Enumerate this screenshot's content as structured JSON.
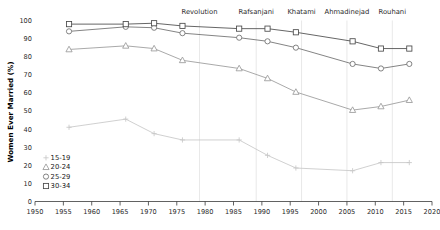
{
  "chart_data": {
    "type": "line",
    "title": "",
    "xlabel": "",
    "ylabel": "Women Ever Married (%)",
    "xlim": [
      1950,
      2020
    ],
    "ylim": [
      0,
      100
    ],
    "xticks": [
      1950,
      1955,
      1960,
      1965,
      1970,
      1975,
      1980,
      1985,
      1990,
      1995,
      2000,
      2005,
      2010,
      2015,
      2020
    ],
    "yticks": [
      0,
      10,
      20,
      30,
      40,
      50,
      60,
      70,
      80,
      90,
      100
    ],
    "grid": false,
    "legend_position": "lower-left",
    "x": [
      1956,
      1966,
      1971,
      1976,
      1986,
      1991,
      1996,
      2006,
      2011,
      2016
    ],
    "series": [
      {
        "name": "15-19",
        "marker": "plus",
        "color": "#c8c8c8",
        "values": [
          41,
          45.5,
          37.5,
          34,
          34,
          25.5,
          18.5,
          17,
          21.5,
          21.5
        ]
      },
      {
        "name": "20-24",
        "marker": "triangle",
        "color": "#9a9a9a",
        "values": [
          84,
          86,
          84.5,
          78,
          73.5,
          68,
          60.5,
          50.5,
          52.5,
          56
        ]
      },
      {
        "name": "25-29",
        "marker": "circle",
        "color": "#6e6e6e",
        "values": [
          94,
          96.5,
          96,
          93,
          90.5,
          88.5,
          85,
          76,
          73.5,
          76
        ]
      },
      {
        "name": "30-34",
        "marker": "square",
        "color": "#4a4a4a",
        "values": [
          98,
          98,
          98.5,
          97,
          95.5,
          95.5,
          93.5,
          88.5,
          84.5,
          84.5
        ]
      }
    ],
    "annotations": [
      {
        "label": "Revolution",
        "x": 1979
      },
      {
        "label": "Rafsanjani",
        "x": 1989
      },
      {
        "label": "Khatami",
        "x": 1997
      },
      {
        "label": "Ahmadinejad",
        "x": 2005
      },
      {
        "label": "Rouhani",
        "x": 2013
      }
    ]
  },
  "legend": {
    "items": [
      {
        "label": "15-19",
        "marker": "plus"
      },
      {
        "label": "20-24",
        "marker": "triangle"
      },
      {
        "label": "25-29",
        "marker": "circle"
      },
      {
        "label": "30-34",
        "marker": "square"
      }
    ]
  }
}
